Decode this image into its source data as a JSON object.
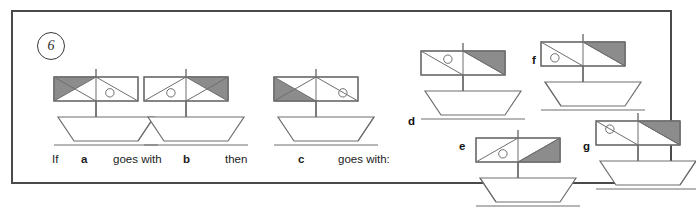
{
  "question": {
    "number": "6",
    "prompt_parts": [
      {
        "text": "If",
        "bold": false,
        "x": 39,
        "y": 141
      },
      {
        "text": "a",
        "bold": true,
        "x": 68,
        "y": 141
      },
      {
        "text": "goes with",
        "bold": false,
        "x": 100,
        "y": 141
      },
      {
        "text": "b",
        "bold": true,
        "x": 170,
        "y": 141
      },
      {
        "text": "then",
        "bold": false,
        "x": 212,
        "y": 141
      },
      {
        "text": "c",
        "bold": true,
        "x": 285,
        "y": 141
      },
      {
        "text": "goes with:",
        "bold": false,
        "x": 325,
        "y": 141
      }
    ]
  },
  "style": {
    "line_color": "#6e6e6e",
    "sail_fill": "#8c8c8c",
    "frame_color": "#4a4a4a",
    "text_color": "#1c1c1c",
    "background": "#ffffff"
  },
  "figures": [
    {
      "id": "a",
      "role": "stem",
      "x": 33,
      "y": 57,
      "label": null,
      "hull": "bow-right",
      "sail": {
        "left": {
          "shade": "triangle-top-left",
          "diagonal": "tl-br",
          "circle": null
        },
        "right": {
          "shade": "none",
          "diagonal": "tl-br",
          "circle": "below-left"
        }
      }
    },
    {
      "id": "b",
      "role": "stem",
      "x": 123,
      "y": 57,
      "label": null,
      "hull": "plain-trapezoid",
      "sail": {
        "left": {
          "shade": "none",
          "diagonal": "bl-tr",
          "circle": "below-right"
        },
        "right": {
          "shade": "triangle-top-right",
          "diagonal": "bl-tr",
          "circle": null
        }
      }
    },
    {
      "id": "c",
      "role": "stem",
      "x": 253,
      "y": 57,
      "label": null,
      "hull": "bow-right",
      "sail": {
        "left": {
          "shade": "triangle-bottom-left",
          "diagonal": "bl-tr",
          "circle": null
        },
        "right": {
          "shade": "none",
          "diagonal": "tl-br",
          "circle": "below-right"
        }
      }
    },
    {
      "id": "d",
      "role": "option",
      "x": 400,
      "y": 31,
      "label": "d",
      "label_x": 395,
      "label_y": 103,
      "hull": "plain-trapezoid",
      "sail": {
        "left": {
          "shade": "none",
          "diagonal": "tl-br",
          "circle": "above-right"
        },
        "right": {
          "shade": "triangle-top-right",
          "diagonal": "tl-br",
          "circle": null
        }
      }
    },
    {
      "id": "e",
      "role": "option",
      "x": 455,
      "y": 118,
      "label": "e",
      "label_x": 446,
      "label_y": 128,
      "hull": "bow-left",
      "sail": {
        "left": {
          "shade": "none",
          "diagonal": "bl-tr",
          "circle": "below-right"
        },
        "right": {
          "shade": "triangle-bottom-right",
          "diagonal": "bl-tr",
          "circle": null
        }
      }
    },
    {
      "id": "f",
      "role": "option",
      "x": 520,
      "y": 22,
      "label": "f",
      "label_x": 519,
      "label_y": 42,
      "hull": "bow-left",
      "sail": {
        "left": {
          "shade": "none",
          "diagonal": "tl-br",
          "circle": "below-left"
        },
        "right": {
          "shade": "triangle-top-right",
          "diagonal": "tl-br",
          "circle": null
        }
      }
    },
    {
      "id": "g",
      "role": "option",
      "x": 575,
      "y": 101,
      "label": "g",
      "label_x": 570,
      "label_y": 128,
      "hull": "bow-right",
      "sail": {
        "left": {
          "shade": "none",
          "diagonal": "tl-br",
          "circle": "above-left"
        },
        "right": {
          "shade": "triangle-top-right",
          "diagonal": "tl-br",
          "circle": null
        }
      }
    }
  ]
}
